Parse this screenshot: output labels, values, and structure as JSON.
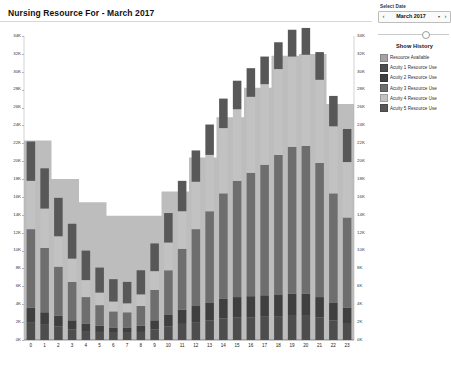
{
  "header": {
    "title": "Nursing Resource For - March 2017"
  },
  "controls": {
    "select_date_label": "Select Date",
    "date_value": "March 2017",
    "prev_icon": "chevron-left-icon",
    "next_icon": "chevron-right-icon",
    "caret_icon": "chevron-down-icon",
    "show_history_label": "Show History",
    "slider_position_pct": 68
  },
  "legend": {
    "items": [
      {
        "label": "Resource Available",
        "color": "#a3a3a3"
      },
      {
        "label": "Acuity 1 Resource Use",
        "color": "#4d4d4d"
      },
      {
        "label": "Acuity 2 Resource Use",
        "color": "#3f3f3f"
      },
      {
        "label": "Acuity 3 Resource Use",
        "color": "#6e6e6e"
      },
      {
        "label": "Acuity 4 Resource Use",
        "color": "#c2c2c2"
      },
      {
        "label": "Acuity 5 Resource Use",
        "color": "#585858"
      }
    ]
  },
  "chart_data": {
    "type": "bar",
    "title": "Nursing Resource For - March 2017",
    "xlabel": "",
    "ylabel": "",
    "ylim": [
      0,
      34000
    ],
    "ytick_step": 2000,
    "grid": false,
    "legend_position": "right",
    "ytick_labels": [
      "0K",
      "2K",
      "4K",
      "6K",
      "8K",
      "10K",
      "12K",
      "14K",
      "16K",
      "18K",
      "20K",
      "22K",
      "24K",
      "26K",
      "28K",
      "30K",
      "32K",
      "34K"
    ],
    "ytick_values": [
      0,
      2000,
      4000,
      6000,
      8000,
      10000,
      12000,
      14000,
      16000,
      18000,
      20000,
      22000,
      24000,
      26000,
      28000,
      30000,
      32000,
      34000
    ],
    "categories": [
      "0",
      "1",
      "2",
      "3",
      "4",
      "5",
      "6",
      "7",
      "8",
      "9",
      "10",
      "11",
      "12",
      "13",
      "14",
      "15",
      "16",
      "17",
      "18",
      "19",
      "20",
      "21",
      "22",
      "23"
    ],
    "area_series": {
      "name": "Resource Available",
      "color": "#a3a3a3",
      "values": [
        22300,
        22300,
        18000,
        18000,
        15400,
        15400,
        13900,
        13900,
        13900,
        13900,
        16600,
        16600,
        20400,
        20400,
        24900,
        24900,
        28200,
        28200,
        31800,
        31800,
        32000,
        32000,
        26400,
        26400
      ]
    },
    "series": [
      {
        "name": "Acuity 1 Resource Use",
        "color": "#4d4d4d",
        "values": [
          2000,
          1700,
          1500,
          1200,
          1000,
          900,
          800,
          800,
          900,
          1200,
          1500,
          1800,
          2000,
          2200,
          2400,
          2500,
          2500,
          2600,
          2600,
          2700,
          2700,
          2500,
          2200,
          1900
        ]
      },
      {
        "name": "Acuity 2 Resource Use",
        "color": "#3f3f3f",
        "values": [
          1600,
          1400,
          1200,
          1000,
          800,
          700,
          600,
          600,
          700,
          1000,
          1300,
          1600,
          1800,
          2000,
          2200,
          2300,
          2400,
          2400,
          2500,
          2500,
          2500,
          2300,
          2000,
          1700
        ]
      },
      {
        "name": "Acuity 3 Resource Use",
        "color": "#6e6e6e",
        "values": [
          8800,
          7200,
          5500,
          4300,
          3000,
          2300,
          1800,
          1700,
          2200,
          3400,
          5000,
          6800,
          8600,
          10200,
          11800,
          13000,
          13800,
          14600,
          15600,
          16400,
          16500,
          15000,
          12200,
          10100
        ]
      },
      {
        "name": "Acuity 4 Resource Use",
        "color": "#c2c2c2",
        "values": [
          5400,
          4400,
          3400,
          2600,
          1900,
          1400,
          1100,
          1000,
          1300,
          2100,
          3100,
          4200,
          5300,
          6300,
          7300,
          8000,
          8500,
          9000,
          9600,
          10100,
          10200,
          9300,
          7500,
          6200
        ]
      },
      {
        "name": "Acuity 5 Resource Use",
        "color": "#585858",
        "values": [
          4400,
          4500,
          4300,
          3900,
          3300,
          2800,
          2500,
          2400,
          2700,
          3100,
          3300,
          3400,
          3500,
          3400,
          3300,
          3200,
          3200,
          3100,
          3000,
          3000,
          3000,
          3100,
          3400,
          3700
        ]
      }
    ]
  }
}
